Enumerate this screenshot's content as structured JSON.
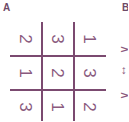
{
  "panels": [
    {
      "label": "A"
    },
    {
      "label": "B"
    }
  ],
  "grid": {
    "rotation_deg": 90,
    "color": "#7b4a70",
    "rows": [
      [
        "2",
        "3",
        "1"
      ],
      [
        "1",
        "2",
        "3"
      ],
      [
        "3",
        "1",
        "2"
      ]
    ]
  },
  "panel_b_partial": [
    "∧",
    "↔",
    "∧"
  ]
}
